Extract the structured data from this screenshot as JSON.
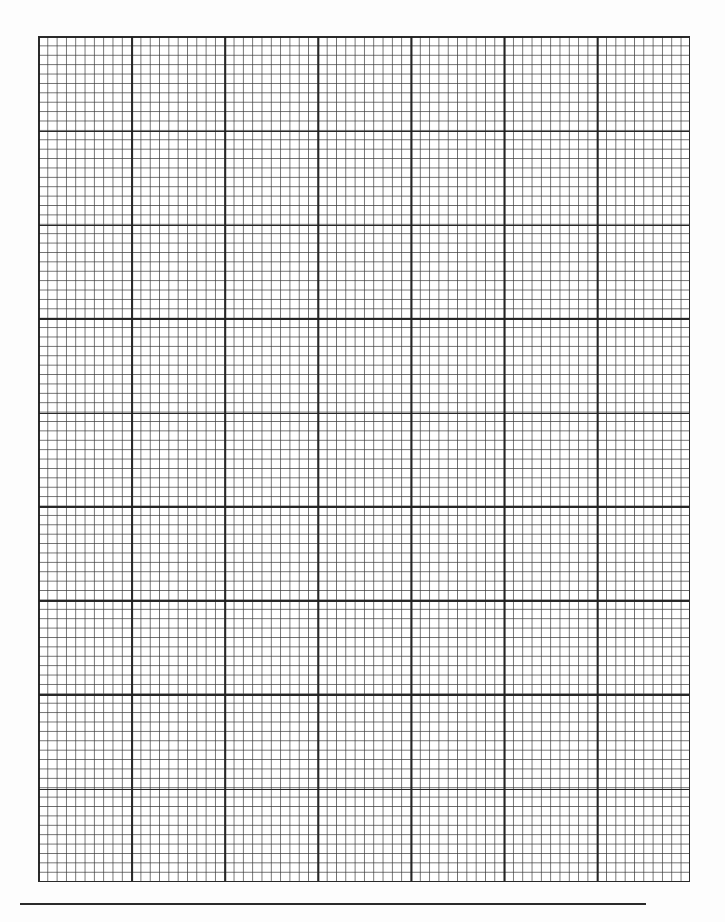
{
  "document": {
    "type": "graph-paper",
    "grid": {
      "major_columns": 7,
      "major_rows": 9,
      "minor_per_major": 10,
      "line_color_major": "#2a2a2a",
      "line_color_minor": "#3c3c3c",
      "background": "#ffffff"
    },
    "footer_rule": {
      "color": "#2a2a2a"
    }
  }
}
